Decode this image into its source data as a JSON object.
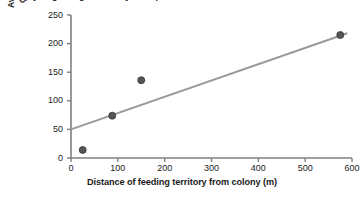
{
  "figure": {
    "clipped_top_caption": "apply to gaining a territory for a pair",
    "background_color": "#ffffff"
  },
  "chart_data": {
    "type": "scatter",
    "title": "",
    "xlabel": "Distance of feeding territory from colony (m)",
    "ylabel": "Average mass of insects carried to colony (mg)",
    "ylabel_line1": "Average mass of insects",
    "ylabel_line2": "carried to colony (mg)",
    "xlim": [
      0,
      600
    ],
    "ylim": [
      0,
      250
    ],
    "xticks": [
      0,
      100,
      200,
      300,
      400,
      500,
      600
    ],
    "yticks": [
      0,
      50,
      100,
      150,
      200,
      250
    ],
    "xtick_labels": [
      "0",
      "100",
      "200",
      "300",
      "400",
      "500",
      "600"
    ],
    "ytick_labels": [
      "0",
      "50",
      "100",
      "150",
      "200",
      "250"
    ],
    "grid": false,
    "legend": false,
    "points": [
      {
        "x": 25,
        "y": 14
      },
      {
        "x": 88,
        "y": 74
      },
      {
        "x": 150,
        "y": 136
      },
      {
        "x": 575,
        "y": 215
      }
    ],
    "trend_line": {
      "x_start": 0,
      "y_start": 50,
      "x_end": 590,
      "y_end": 218,
      "color": "#9a9a9a"
    },
    "marker_color": "#555555",
    "marker_edge_color": "#333333",
    "marker_size": 6,
    "axis_color": "#808080"
  }
}
